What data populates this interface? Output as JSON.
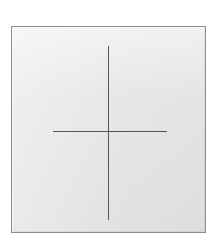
{
  "canvas": {
    "width_px": 218,
    "height_px": 247,
    "background_color": "#ffffff"
  },
  "panel": {
    "name": "crosshair-panel",
    "fill_color": "#e6e6e6",
    "border_color": "#8d8d8d",
    "border_width_px": 1,
    "left_px": 11,
    "top_px": 26,
    "width_px": 195,
    "height_px": 207
  },
  "marker": {
    "type": "crosshair",
    "line_color": "#565656",
    "line_width_px": 1,
    "center": {
      "x_px": 108,
      "y_px": 131
    },
    "vertical": {
      "x_px": 108,
      "y_top_px": 46,
      "y_bottom_px": 220,
      "length_px": 174
    },
    "horizontal": {
      "y_px": 131,
      "x_left_px": 53,
      "x_right_px": 167,
      "length_px": 114
    }
  }
}
